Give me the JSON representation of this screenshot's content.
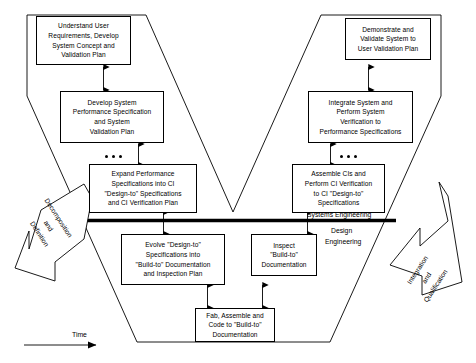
{
  "diagram": {
    "time_axis_label": "Time",
    "divider": {
      "above_label": "Systems Engineering",
      "below_label_line1": "Design",
      "below_label_line2": "Engineering"
    },
    "left_banner": {
      "line1": "Decomposition",
      "line2": "and",
      "line3": "Definition"
    },
    "right_banner": {
      "line1": "Integration",
      "line2": "and",
      "line3": "Qualification"
    },
    "ellipsis_groups": [
      {
        "name": "left-ellipsis",
        "dot_count": 3
      },
      {
        "name": "right-ellipsis",
        "dot_count": 3
      }
    ],
    "boxes": [
      {
        "id": "understand-user-requirements",
        "lines": [
          "Understand User",
          "Requirements, Develop",
          "System Concept and",
          "Validation Plan"
        ]
      },
      {
        "id": "develop-system-performance-specification",
        "lines": [
          "Develop System",
          "Performance Specification",
          "and System",
          "Validation Plan"
        ]
      },
      {
        "id": "expand-performance-specifications",
        "lines": [
          "Expand Performance",
          "Specifications into CI",
          "\"Design-to\" Specifications",
          "and CI Verification  Plan"
        ]
      },
      {
        "id": "evolve-design-to-specifications",
        "lines": [
          "Evolve \"Design-to\"",
          "Specifications into",
          "\"Build-to\" Documentation",
          "and Inspection Plan"
        ]
      },
      {
        "id": "fab-assemble-and-code",
        "lines": [
          "Fab, Assemble and",
          "Code to \"Build-to\"",
          "Documentation"
        ]
      },
      {
        "id": "inspect-build-to-documentation",
        "lines": [
          "Inspect",
          "\"Build-to\"",
          "Documentation"
        ]
      },
      {
        "id": "assemble-cis-and-perform-ci-verification",
        "lines": [
          "Assemble CIs and",
          "Perform CI Verification",
          "to CI \"Design-to\"",
          "Specifications"
        ]
      },
      {
        "id": "integrate-system-and-perform-verification",
        "lines": [
          "Integrate System and",
          "Perform System",
          "Verification to",
          "Performance Specifications"
        ]
      },
      {
        "id": "demonstrate-and-validate-system",
        "lines": [
          "Demonstrate and",
          "Validate System to",
          "User Validation Plan"
        ]
      }
    ],
    "colors": {
      "stroke": "#000000",
      "fill": "#ffffff",
      "divider": "#000000"
    }
  }
}
